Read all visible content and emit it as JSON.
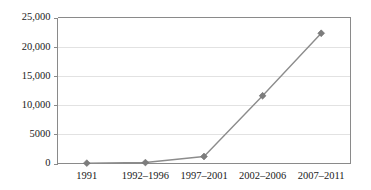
{
  "chart_data": {
    "type": "line",
    "title": "",
    "subtitle": "",
    "xlabel": "",
    "ylabel": "",
    "categories": [
      "1991",
      "1992–1996",
      "1997–2001",
      "2002–2006",
      "2007–2011"
    ],
    "series": [
      {
        "name": "",
        "values": [
          60,
          160,
          1200,
          11600,
          22300
        ],
        "marker": "diamond",
        "color": "#8c8c8c"
      }
    ],
    "ylim": [
      0,
      25000
    ],
    "ytick_values": [
      0,
      5000,
      10000,
      15000,
      20000,
      25000
    ],
    "ytick_labels": [
      "0",
      "5000",
      "10,000",
      "15,000",
      "20,000",
      "25,000"
    ],
    "xtick_labels": [
      "1991",
      "1992–1996",
      "1997–2001",
      "2002–2006",
      "2007–2011"
    ],
    "grid": true,
    "grid_axis": "y",
    "legend": false,
    "legend_position": "none",
    "colors": {
      "line": "#8c8c8c",
      "marker": "#7d7d7d",
      "gridline": "#e2e2e2",
      "axis": "#8a8a8a",
      "text": "#1a1a1a",
      "background": "#ffffff"
    }
  }
}
